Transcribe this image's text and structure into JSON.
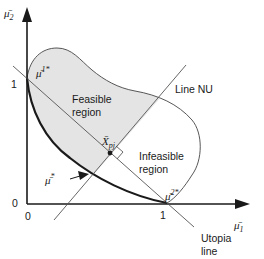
{
  "diagram": {
    "axes": {
      "x_label": "μ̄",
      "x_label_sub": "1",
      "y_label": "μ̄",
      "y_label_sub": "2",
      "x_ticks": [
        "0",
        "1"
      ],
      "y_ticks": [
        "0",
        "1"
      ]
    },
    "points": {
      "anchor1": {
        "base": "μ̄",
        "sup": "1*"
      },
      "anchor2": {
        "base": "μ̄",
        "sup": "2*"
      },
      "pareto_point": {
        "base": "μ̄",
        "sup": "*"
      },
      "utopia_point": {
        "base": "X̄",
        "sub": "pj"
      }
    },
    "regions": {
      "feasible_line1": "Feasible",
      "feasible_line2": "region",
      "infeasible_line1": "Infeasible",
      "infeasible_line2": "region"
    },
    "lines": {
      "normal_line": "Line NU",
      "utopia_line_1": "Utopia",
      "utopia_line_2": "line"
    },
    "colors": {
      "feasible_fill": "#e4e4e4",
      "stroke": "#1a1a1a",
      "thin_stroke": "#555555"
    }
  }
}
